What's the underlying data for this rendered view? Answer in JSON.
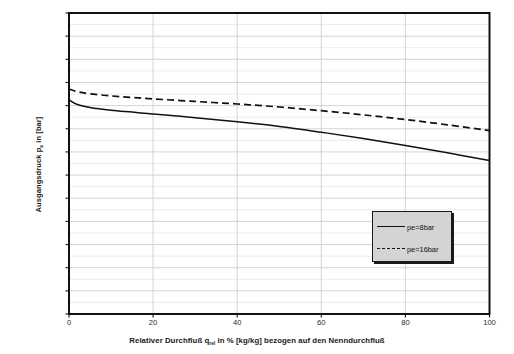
{
  "chart_data": {
    "type": "line",
    "title": "",
    "xlabel": "Relativer Durchfluß q_rel in % [kg/kg] bezogen auf den Nenndurchfluß",
    "ylabel": "Ausgangsdruck p_a in [bar]",
    "xlim": [
      0,
      100
    ],
    "ylim": [
      0.8,
      2.1
    ],
    "xticks": [
      0,
      20,
      40,
      60,
      80,
      100
    ],
    "xtick_labels": [
      "0",
      "20",
      "40",
      "60",
      "80",
      "100"
    ],
    "yticks": [
      0.8,
      0.9,
      1.0,
      1.1,
      1.2,
      1.3,
      1.4,
      1.5,
      1.6,
      1.7,
      1.8,
      1.9,
      2.0,
      2.1
    ],
    "ytick_labels": [
      "0,8",
      "0,9",
      "1,0",
      "1,1",
      "1,2",
      "1,3",
      "1,4",
      "1,5",
      "1,6",
      "1,7",
      "1,8",
      "1,9",
      "2,0",
      "2,1"
    ],
    "grid": true,
    "grid_minor_step": 0.05,
    "grid_color": "#d8d8d8",
    "legend_position": "lower right",
    "x": [
      0,
      2,
      5,
      10,
      15,
      20,
      30,
      40,
      50,
      60,
      70,
      80,
      90,
      100
    ],
    "series": [
      {
        "name": "pe=8bar",
        "style": "solid",
        "color": "#111111",
        "values": [
          1.725,
          1.705,
          1.692,
          1.68,
          1.672,
          1.664,
          1.648,
          1.63,
          1.61,
          1.585,
          1.558,
          1.528,
          1.496,
          1.463
        ]
      },
      {
        "name": "pe=16bar",
        "style": "dashed",
        "color": "#111111",
        "values": [
          1.772,
          1.76,
          1.751,
          1.742,
          1.735,
          1.729,
          1.718,
          1.707,
          1.694,
          1.678,
          1.66,
          1.64,
          1.617,
          1.592
        ]
      }
    ]
  },
  "axis": {
    "y_title_main": "Ausgangsdruck p",
    "y_title_sub": "a",
    "y_title_tail": " in [bar]",
    "x_title_pre": "Relativer Durchfluß q",
    "x_title_sub": "rel",
    "x_title_tail": " in % [kg/kg] bezogen auf den Nenndurchfluß"
  },
  "legend": {
    "items": [
      {
        "label": "pe=8bar",
        "style": "solid"
      },
      {
        "label": "pe=16bar",
        "style": "dashed"
      }
    ]
  }
}
